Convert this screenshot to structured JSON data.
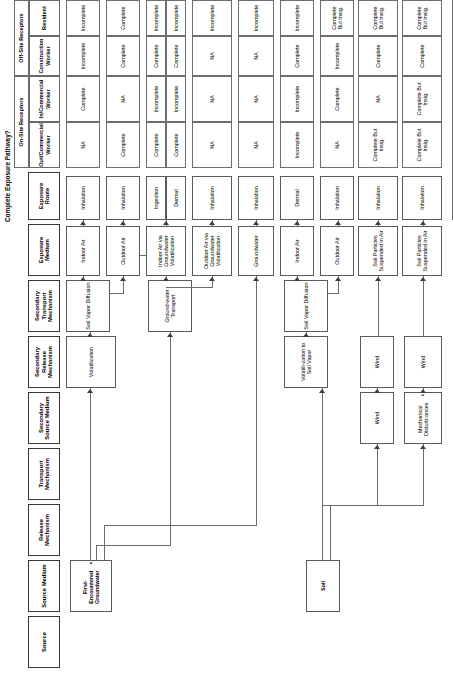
{
  "title": "Complete Exposure Pathway?",
  "columns": {
    "source": "Source",
    "source_medium": "Source Medium",
    "release_mechanism": "Release Mechanism",
    "transport_mechanism": "Transport Mechanism",
    "secondary_source_medium": "Secondary Source Medium",
    "secondary_release_mechanism": "Secondary Release Mechanism",
    "secondary_transport_mechanism": "Secondary Transport Mechanism",
    "exposure_medium": "Exposure Medium",
    "exposure_route": "Exposure Route"
  },
  "receptor_groups": [
    {
      "label": "On-Site Receptors",
      "span": 2
    },
    {
      "label": "Off-Site Receptors",
      "span": 2
    }
  ],
  "receptor_columns": [
    "Out/Commercial Worker",
    "In/Commercial Worker",
    "Construction Worker",
    "Resident"
  ],
  "sources": [
    {
      "id": "gw",
      "label": "First-Encountered Groundwater",
      "footnote": "a"
    },
    {
      "id": "soil",
      "label": "Soil",
      "footnote": ""
    }
  ],
  "nodes": {
    "volatilization": "Volatilization",
    "soil_vapor_diffusion": "Soil Vapor Diffusion",
    "groundwater_transport": "Ground-water Transport",
    "volatilization_to_soil_vapor": "Volatili-zation to Soil Vapor",
    "soil_vapor_diffusion2": "Soil Vapor Diffusion",
    "wind1": "Wind",
    "wind2": "Wind",
    "mechanical_disturbances": "Mechanical Disturb-ances",
    "wind3": "Wind",
    "indoor_air": "Indoor Air",
    "outdoor_air": "Outdoor Air",
    "indoor_air_gw_volatilization": "Indoor Air via Groundwater Volatilization",
    "outdoor_air_gw_volatilization": "Outdoor Air via Groundwater Volatilization",
    "groundwater": "Groundwater",
    "indoor_air2": "Indoor Air",
    "outdoor_air2": "Outdoor Air",
    "soil_particles1": "Soil Particles Suspended in Air",
    "soil_particles2": "Soil Particles Suspended in Air"
  },
  "pathways": [
    {
      "id": "p1",
      "exposure_medium": "Indoor Air",
      "exposure_route": "Inhalation",
      "receptors": [
        "NA",
        "Complete",
        "Incomplete",
        "Incomplete"
      ]
    },
    {
      "id": "p2",
      "exposure_medium": "Outdoor Air",
      "exposure_route": "Inhalation",
      "receptors": [
        "Complete",
        "NA",
        "Complete",
        "Complete"
      ]
    },
    {
      "id": "p3a",
      "exposure_medium": "Indoor Air via Groundwater Volatilization",
      "exposure_route": "Ingestion",
      "receptors": [
        "Complete",
        "Incomplete",
        "Complete",
        "Incomplete"
      ]
    },
    {
      "id": "p3b",
      "exposure_medium": "",
      "exposure_route": "Dermal",
      "receptors": [
        "Complete",
        "Incomplete",
        "Complete",
        "Incomplete"
      ]
    },
    {
      "id": "p4",
      "exposure_medium": "Outdoor Air via Groundwater Volatilization",
      "exposure_route": "Inhalation",
      "receptors": [
        "NA",
        "NA",
        "NA",
        "Incomplete"
      ]
    },
    {
      "id": "p5",
      "exposure_medium": "Groundwater",
      "exposure_route": "Inhalation",
      "receptors": [
        "NA",
        "NA",
        "NA",
        "Incomplete"
      ]
    },
    {
      "id": "p6",
      "exposure_medium": "Indoor Air",
      "exposure_route": "Dermal",
      "receptors": [
        "Incomplete",
        "Incomplete",
        "Complete",
        "Incomplete"
      ]
    },
    {
      "id": "p7",
      "exposure_medium": "Outdoor Air",
      "exposure_route": "Inhalation",
      "receptors": [
        "NA",
        "Complete",
        "Incomplete",
        "Complete But Insig."
      ]
    },
    {
      "id": "p8",
      "exposure_medium": "Soil Particles Suspended in Air",
      "exposure_route": "Inhalation",
      "receptors": [
        "Complete But Insig.",
        "NA",
        "Complete",
        "Complete But Insig."
      ]
    },
    {
      "id": "p9",
      "exposure_medium": "Soil Particles Suspended in Air",
      "exposure_route": "Inhalation",
      "receptors": [
        "Complete But Insig.",
        "Complete But Insig.",
        "Complete",
        "Complete But Insig."
      ]
    }
  ],
  "colors": {
    "box_border": "#5a5a5a",
    "line": "#6b6b6b",
    "text": "#000000",
    "background": "#ffffff"
  }
}
